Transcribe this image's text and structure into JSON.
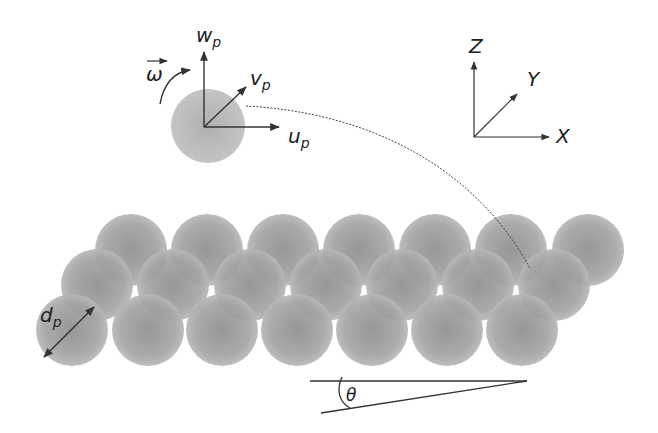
{
  "diagram": {
    "colors": {
      "sphere": "#a9a9a9",
      "sphere_dark": "#8f8f8f",
      "line": "#333333",
      "background": "#ffffff"
    },
    "particle": {
      "label_w": "w",
      "label_w_sub": "p",
      "label_v": "v",
      "label_v_sub": "p",
      "label_u": "u",
      "label_u_sub": "p",
      "label_omega": "ω",
      "omega_arrow": "→"
    },
    "global_axes": {
      "label_z": "Z",
      "label_y": "Y",
      "label_x": "X"
    },
    "bed": {
      "diameter_label": "d",
      "diameter_sub": "p",
      "rows": [
        {
          "name": "back",
          "cy": 250,
          "cx": [
            131,
            207,
            283,
            359,
            435,
            511,
            588
          ]
        },
        {
          "name": "middle",
          "cy": 285,
          "cx": [
            97,
            173,
            250,
            326,
            402,
            478,
            554
          ]
        },
        {
          "name": "front",
          "cy": 330,
          "cx": [
            72,
            148,
            222,
            297,
            372,
            447,
            522
          ]
        }
      ],
      "radius": 36
    },
    "incline": {
      "angle_label": "θ"
    }
  }
}
